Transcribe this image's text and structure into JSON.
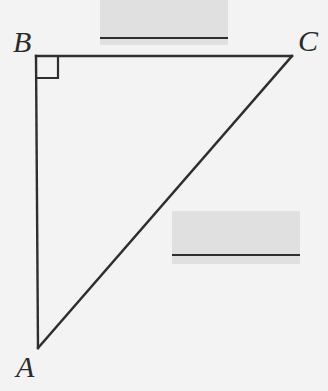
{
  "figure": {
    "type": "right-triangle-diagram",
    "background_color": "#f3f3f3",
    "stroke_color": "#2e2e2e",
    "redaction_color": "#e0e0e0",
    "label_color": "#2b2b2b"
  },
  "vertices": {
    "A": {
      "label": "A",
      "x": 38,
      "y": 348
    },
    "B": {
      "label": "B",
      "x": 36,
      "y": 56
    },
    "C": {
      "label": "C",
      "x": 292,
      "y": 56
    }
  },
  "sides": {
    "AB": {
      "from": "A",
      "to": "B",
      "orientation": "vertical"
    },
    "BC": {
      "from": "B",
      "to": "C",
      "orientation": "horizontal"
    },
    "AC": {
      "from": "A",
      "to": "C",
      "orientation": "hypotenuse"
    }
  },
  "right_angle": {
    "at_vertex": "B",
    "marker": "square",
    "size": 22
  },
  "annotations": [
    {
      "name": "top-redacted-measure",
      "text": "",
      "underline": true,
      "x": 100,
      "y": 0,
      "width": 128,
      "height": 45
    },
    {
      "name": "middle-redacted-measure",
      "text": "",
      "underline": true,
      "x": 172,
      "y": 211,
      "width": 128,
      "height": 53
    }
  ]
}
